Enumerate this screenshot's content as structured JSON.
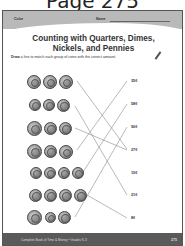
{
  "page_heading": "Page 275",
  "worksheet": {
    "header": {
      "color_label": "Color",
      "name_label": "Name"
    },
    "title_line1": "Counting with Quarters, Dimes,",
    "title_line2": "Nickels, and Pennies",
    "instruction_bold": "Draw",
    "instruction_rest": " a line to match each group of coins with the correct amount.",
    "coin_groups": [
      {
        "coins": [
          "quarter",
          "nickel",
          "nickel"
        ],
        "matched_amount": "27¢"
      },
      {
        "coins": [
          "dime",
          "dime",
          "nickel"
        ],
        "matched_amount": "21¢"
      },
      {
        "coins": [
          "quarter",
          "nickel",
          "dime"
        ],
        "matched_amount": "27¢"
      },
      {
        "coins": [
          "quarter",
          "dime",
          "nickel"
        ],
        "matched_amount": "35¢"
      },
      {
        "coins": [
          "dime",
          "dime",
          "dime",
          "dime"
        ],
        "matched_amount": "58¢"
      },
      {
        "coins": [
          "nickel",
          "nickel",
          "dime",
          "penny"
        ],
        "matched_amount": "8¢"
      },
      {
        "coins": [
          "quarter",
          "penny",
          "nickel"
        ],
        "matched_amount": "90¢"
      }
    ],
    "amounts": [
      "35¢",
      "58¢",
      "90¢",
      "27¢",
      "15¢",
      "21¢",
      "8¢"
    ],
    "footer": {
      "book_title": "Complete Book of Time & Money • Grades K-3",
      "page_number": "275"
    }
  },
  "colors": {
    "header_band": "#b9b9b9",
    "footer_band": "#5a5a5a",
    "line": "#888888"
  }
}
